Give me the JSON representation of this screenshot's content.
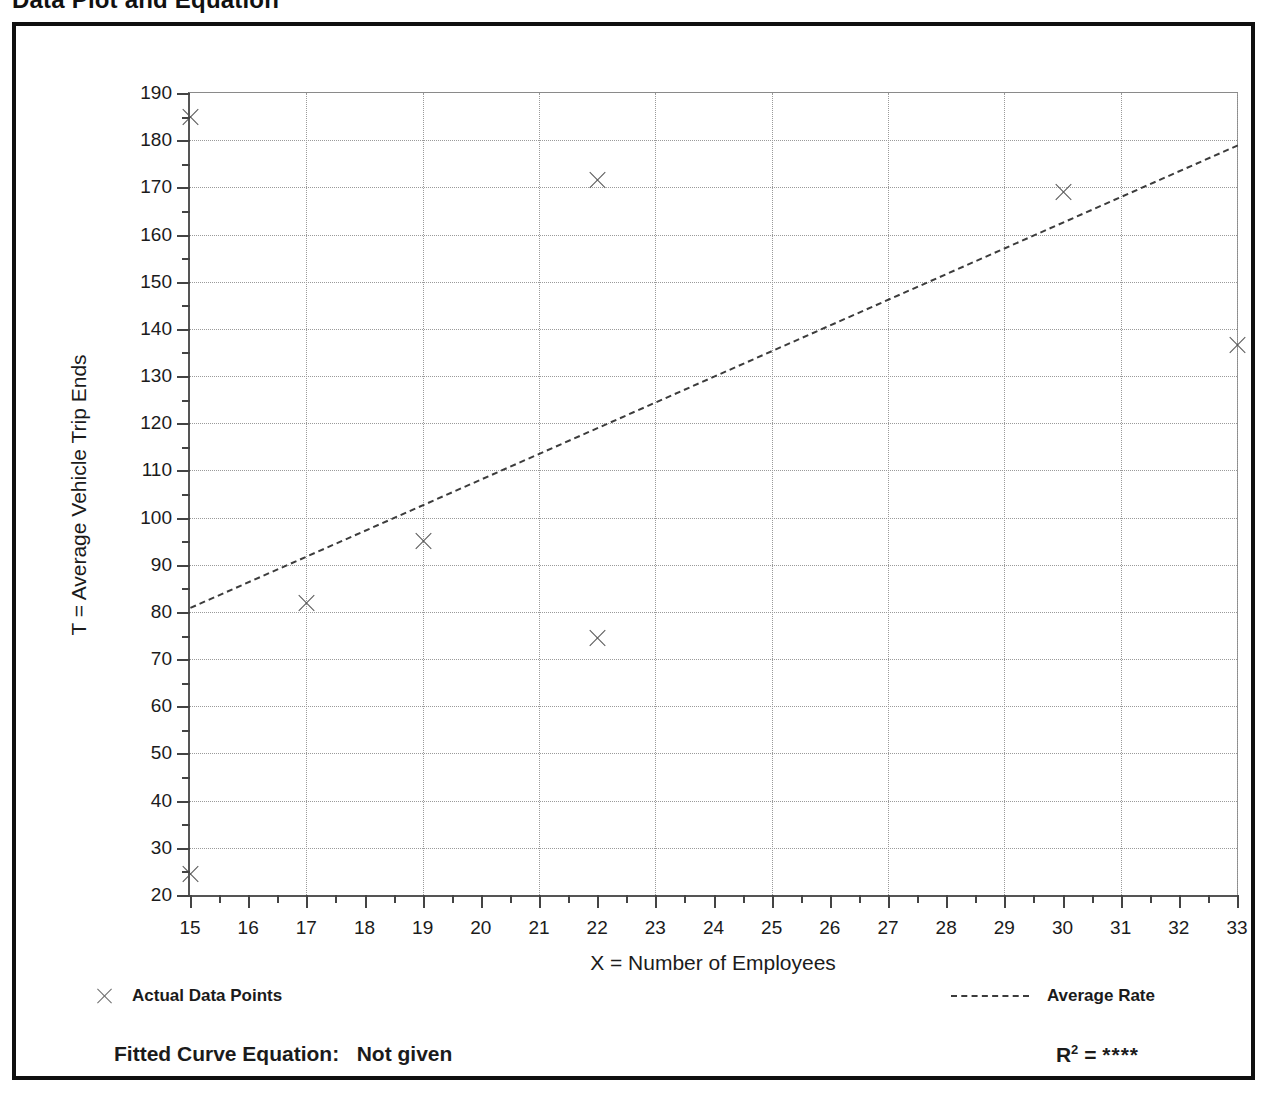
{
  "page": {
    "title": "Data Plot and Equation"
  },
  "chart_data": {
    "type": "scatter",
    "title": "Data Plot and Equation",
    "xlabel": "X = Number of Employees",
    "ylabel": "T = Average Vehicle Trip Ends",
    "xlim": [
      15,
      33
    ],
    "ylim": [
      20,
      190
    ],
    "x_ticks": [
      15,
      16,
      17,
      18,
      19,
      20,
      21,
      22,
      23,
      24,
      25,
      26,
      27,
      28,
      29,
      30,
      31,
      32,
      33
    ],
    "x_tick_labels": [
      "15",
      "16",
      "17",
      "18",
      "19",
      "20",
      "21",
      "22",
      "23",
      "24",
      "25",
      "26",
      "27",
      "28",
      "29",
      "30",
      "31",
      "32",
      "33"
    ],
    "y_ticks": [
      20,
      30,
      40,
      50,
      60,
      70,
      80,
      90,
      100,
      110,
      120,
      130,
      140,
      150,
      160,
      170,
      180,
      190
    ],
    "y_tick_labels": [
      "20",
      "30",
      "40",
      "50",
      "60",
      "70",
      "80",
      "90",
      "100",
      "110",
      "120",
      "130",
      "140",
      "150",
      "160",
      "170",
      "180",
      "190"
    ],
    "y_minor_ticks": [
      25,
      35,
      45,
      55,
      65,
      75,
      85,
      95,
      105,
      115,
      125,
      135,
      145,
      155,
      165,
      175,
      185
    ],
    "grid": {
      "enabled": true,
      "style": "dotted",
      "vertical_at": [
        17,
        19,
        21,
        23,
        25,
        27,
        29,
        31,
        33
      ],
      "horizontal_at": [
        30,
        40,
        50,
        60,
        70,
        80,
        90,
        100,
        110,
        120,
        130,
        140,
        150,
        160,
        170,
        180
      ]
    },
    "series": [
      {
        "name": "Actual Data Points",
        "type": "scatter",
        "marker": "x",
        "color": "#555555",
        "points": [
          {
            "x": 15,
            "y": 185
          },
          {
            "x": 15,
            "y": 24.5
          },
          {
            "x": 17,
            "y": 82
          },
          {
            "x": 19,
            "y": 95
          },
          {
            "x": 22,
            "y": 171.5
          },
          {
            "x": 22,
            "y": 74.5
          },
          {
            "x": 30,
            "y": 169
          },
          {
            "x": 33,
            "y": 136.5
          }
        ]
      },
      {
        "name": "Average Rate",
        "type": "line",
        "style": "dashed",
        "color": "#3c3c3c",
        "endpoints": [
          {
            "x": 15,
            "y": 81
          },
          {
            "x": 33,
            "y": 179
          }
        ]
      }
    ],
    "legend": {
      "position": "below-axes",
      "entries": [
        {
          "label": "Actual Data Points",
          "marker": "x"
        },
        {
          "label": "Average Rate",
          "marker": "dashed-line"
        }
      ]
    },
    "annotations": {
      "fitted_curve_equation_label": "Fitted Curve Equation:",
      "fitted_curve_equation_value": "Not given",
      "r_squared_label": "R",
      "r_squared_exponent": "2",
      "r_squared_equals": "=",
      "r_squared_value": "****"
    }
  }
}
